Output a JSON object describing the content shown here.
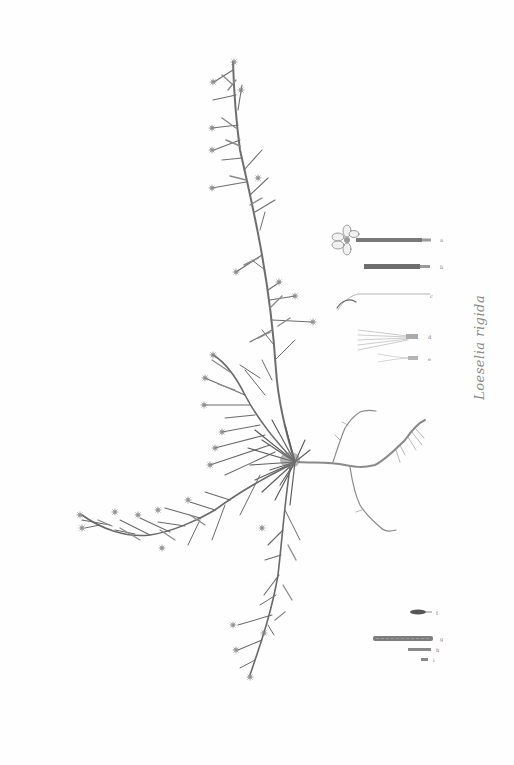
{
  "plate": {
    "caption": "Loeselia rigida",
    "background": "#fefefe",
    "ink_color": "#6b6b6b"
  },
  "detail_figures": {
    "upper_group": [
      "a",
      "b",
      "c",
      "d",
      "e"
    ],
    "lower_group": [
      "f",
      "g",
      "h",
      "i"
    ]
  }
}
